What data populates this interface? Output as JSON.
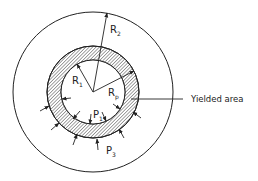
{
  "diagram": {
    "type": "thick-walled cylinder with yielded zone",
    "labels": {
      "R1": {
        "main": "R",
        "sub": "1"
      },
      "R2": {
        "main": "R",
        "sub": "2"
      },
      "Rp": {
        "main": "R",
        "sub": "p"
      },
      "P1": {
        "main": "P",
        "sub": "1"
      },
      "P3": {
        "main": "P",
        "sub": "3"
      },
      "yielded_area": "Yielded area"
    },
    "colors": {
      "line": "#222222",
      "hatch": "#333333",
      "background": "#ffffff"
    }
  }
}
